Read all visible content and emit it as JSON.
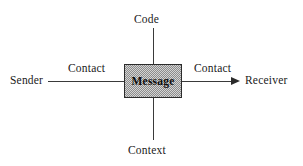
{
  "diagram": {
    "background_color": "#ffffff",
    "line_color": "#3a3a3a",
    "box_fill_color": "#d4d4d4",
    "box_border_color": "#2b2b2b",
    "text_color": "#1a1a1a",
    "center": {
      "label": "Message"
    },
    "nodes": {
      "top": "Code",
      "bottom": "Context",
      "left": "Sender",
      "right": "Receiver"
    },
    "edge_labels": {
      "left": "Contact",
      "right": "Contact"
    },
    "icons": {
      "arrowhead": "arrow-right-icon"
    }
  }
}
